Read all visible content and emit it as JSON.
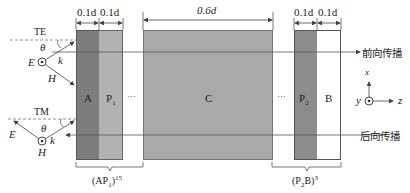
{
  "diagram": {
    "type": "multilayer photonic structure schematic",
    "colors": {
      "layer_A": "#7d7d7d",
      "layer_P": "#b2b2b2",
      "layer_C": "#a9a9a9",
      "layer_P2": "#8c8c8c",
      "layer_B": "#ffffff",
      "line": "#555555"
    },
    "layers": [
      {
        "name": "A",
        "label": "A",
        "thickness": "0.1d"
      },
      {
        "name": "P1",
        "label": "P",
        "sub": "1",
        "thickness": "0.1d"
      },
      {
        "name": "gap1",
        "label": "···"
      },
      {
        "name": "C",
        "label": "C",
        "thickness": "0.6d"
      },
      {
        "name": "gap2",
        "label": "···"
      },
      {
        "name": "P2",
        "label": "P",
        "sub": "2",
        "thickness": "0.1d"
      },
      {
        "name": "B",
        "label": "B",
        "thickness": "0.1d"
      }
    ],
    "dimensions": {
      "a": "0.1d",
      "p1": "0.1d",
      "c": "0.6d",
      "p2": "0.1d",
      "b": "0.1d"
    },
    "groups": {
      "left": {
        "base": "(AP",
        "sub": "1",
        "close": ")",
        "sup": "15"
      },
      "right": {
        "base": "(P",
        "sub": "2",
        "mid": "B)",
        "sup": "3"
      }
    },
    "propagation": {
      "forward": "前向传播",
      "backward": "后向传播"
    },
    "polarization": {
      "te": {
        "title": "TE",
        "theta": "θ",
        "E": "E",
        "k": "k",
        "H": "H"
      },
      "tm": {
        "title": "TM",
        "theta": "θ",
        "E": "E",
        "k": "k",
        "H": "H"
      }
    },
    "axes": {
      "x": "x",
      "y": "y",
      "z": "z"
    }
  }
}
